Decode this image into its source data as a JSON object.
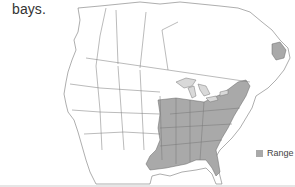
{
  "caption": {
    "text": "bays."
  },
  "map": {
    "region": "North America",
    "colors": {
      "land": "#ffffff",
      "border": "#777777",
      "range": "#a9a9a9",
      "water": "#d9d9d9"
    }
  },
  "legend": {
    "items": [
      {
        "label": "Range",
        "color": "#a9a9a9"
      }
    ]
  }
}
